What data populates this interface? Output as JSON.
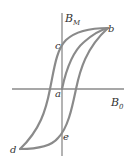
{
  "diagram": {
    "axes": {
      "y_label": "B",
      "y_label_sub": "M",
      "x_label": "B",
      "x_label_sub": "0"
    },
    "points": {
      "a": "a",
      "b": "b",
      "c": "c",
      "d": "d",
      "e": "e"
    },
    "colors": {
      "curve": "#8a8a8a",
      "axis": "#8a8a8a",
      "text": "#333333"
    }
  }
}
